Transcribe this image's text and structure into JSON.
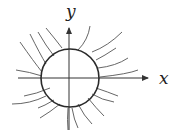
{
  "diagram": {
    "x_label": "x",
    "y_label": "y",
    "colors": {
      "circle": "#2a2a2a",
      "axes": "#333333",
      "curves": "#555555"
    }
  }
}
